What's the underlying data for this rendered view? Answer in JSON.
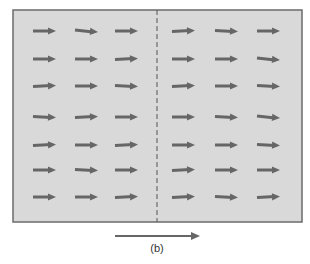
{
  "figure": {
    "caption": "(b)",
    "colors": {
      "panel_fill": "#d9d9d9",
      "panel_border": "#6b6b6b",
      "arrow": "#666666",
      "divider": "#555555"
    },
    "panel": {
      "x": 13,
      "y": 10,
      "width": 289,
      "height": 212
    },
    "divider": {
      "x": 157,
      "style": "dashed"
    },
    "field_arrows": {
      "rows": 7,
      "columns": 6,
      "description": "Uniform field of arrows pointing right on both sides of dashed boundary",
      "row_y": [
        31,
        59,
        86,
        117,
        145,
        170,
        197
      ],
      "column_x": [
        [
          33,
          56
        ],
        [
          75,
          98
        ],
        [
          115,
          138
        ],
        [
          172,
          195
        ],
        [
          215,
          238
        ],
        [
          257,
          280
        ]
      ]
    },
    "direction_arrow": {
      "x1": 115,
      "x2": 200,
      "y": 236,
      "direction": "right"
    }
  }
}
